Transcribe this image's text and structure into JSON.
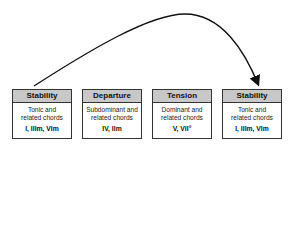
{
  "boxes": [
    {
      "title": "Stability",
      "line1": "Tonic and",
      "line2": "related chords",
      "chords": "I, IIIm, VIm"
    },
    {
      "title": "Departure",
      "line1": "Subdominant and",
      "line2": "related chords",
      "chords": "IV, IIm"
    },
    {
      "title": "Tension",
      "line1": "Dominant and",
      "line2": "related chords",
      "chords": "V, VII°"
    },
    {
      "title": "Stability",
      "line1": "Tonic and",
      "line2": "related chords",
      "chords": "I, IIIm, VIm"
    }
  ],
  "colors": {
    "header_bg": "#c8c8c8",
    "border": "#333333",
    "arrow": "#111111"
  }
}
